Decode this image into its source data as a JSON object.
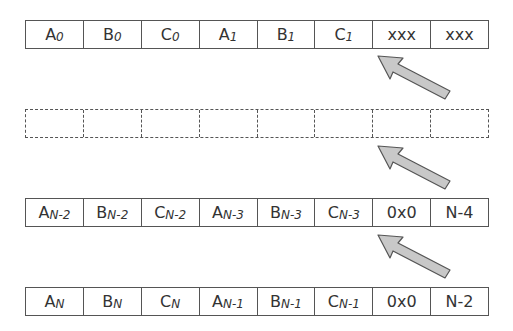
{
  "colors": {
    "border": "#555555",
    "text": "#333333",
    "arrow_fill": "#c8c8c8",
    "arrow_stroke": "#555555"
  },
  "rows": [
    {
      "style": "solid",
      "cells": [
        {
          "main": "A",
          "sub": "0"
        },
        {
          "main": "B",
          "sub": "0"
        },
        {
          "main": "C",
          "sub": "0"
        },
        {
          "main": "A",
          "sub": "1"
        },
        {
          "main": "B",
          "sub": "1"
        },
        {
          "main": "C",
          "sub": "1"
        },
        {
          "main": "xxx",
          "sub": ""
        },
        {
          "main": "xxx",
          "sub": ""
        }
      ]
    },
    {
      "style": "dashed",
      "cells": [
        {
          "main": "",
          "sub": ""
        },
        {
          "main": "",
          "sub": ""
        },
        {
          "main": "",
          "sub": ""
        },
        {
          "main": "",
          "sub": ""
        },
        {
          "main": "",
          "sub": ""
        },
        {
          "main": "",
          "sub": ""
        },
        {
          "main": "",
          "sub": ""
        },
        {
          "main": "",
          "sub": ""
        }
      ]
    },
    {
      "style": "solid",
      "cells": [
        {
          "main": "A",
          "sub": "N-2"
        },
        {
          "main": "B",
          "sub": "N-2"
        },
        {
          "main": "C",
          "sub": "N-2"
        },
        {
          "main": "A",
          "sub": "N-3"
        },
        {
          "main": "B",
          "sub": "N-3"
        },
        {
          "main": "C",
          "sub": "N-3"
        },
        {
          "main": "0x0",
          "sub": ""
        },
        {
          "main": "N-4",
          "sub": ""
        }
      ]
    },
    {
      "style": "solid",
      "cells": [
        {
          "main": "A",
          "sub": "N"
        },
        {
          "main": "B",
          "sub": "N"
        },
        {
          "main": "C",
          "sub": "N"
        },
        {
          "main": "A",
          "sub": "N-1"
        },
        {
          "main": "B",
          "sub": "N-1"
        },
        {
          "main": "C",
          "sub": "N-1"
        },
        {
          "main": "0x0",
          "sub": ""
        },
        {
          "main": "N-2",
          "sub": ""
        }
      ]
    }
  ],
  "arrows": [
    {
      "from_row": 1,
      "to_row": 0,
      "direction": "up-left"
    },
    {
      "from_row": 2,
      "to_row": 1,
      "direction": "up-left"
    },
    {
      "from_row": 3,
      "to_row": 2,
      "direction": "up-left"
    }
  ]
}
